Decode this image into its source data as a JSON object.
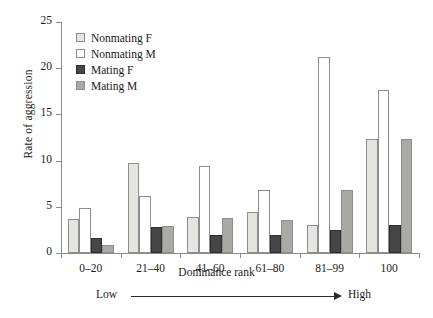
{
  "chart_data": {
    "type": "bar",
    "title": "",
    "xlabel": "Dominance rank",
    "ylabel": "Rate of aggression",
    "categories": [
      "0–20",
      "21–40",
      "41–60",
      "61–80",
      "81–99",
      "100"
    ],
    "ylim": [
      0,
      25
    ],
    "yticks": [
      0,
      5,
      10,
      15,
      20,
      25
    ],
    "ytick_labels": [
      "0",
      "5",
      "10",
      "15",
      "20",
      "25"
    ],
    "grid": false,
    "legend_position": "upper-left-inside",
    "series": [
      {
        "name": "Nonmating F",
        "color": "#e4e4e1",
        "values": [
          3.7,
          9.7,
          3.9,
          4.4,
          3.0,
          12.3
        ]
      },
      {
        "name": "Nonmating M",
        "color": "#ffffff",
        "values": [
          4.9,
          6.2,
          9.4,
          6.8,
          21.2,
          17.6
        ]
      },
      {
        "name": "Mating F",
        "color": "#464646",
        "values": [
          1.6,
          2.8,
          2.0,
          1.9,
          2.5,
          3.0
        ]
      },
      {
        "name": "Mating M",
        "color": "#a9a9a6",
        "values": [
          0.9,
          2.9,
          3.8,
          3.6,
          6.8,
          12.3
        ]
      }
    ],
    "annotations": {
      "axis_arrow_left": "Low",
      "axis_arrow_right": "High"
    }
  }
}
